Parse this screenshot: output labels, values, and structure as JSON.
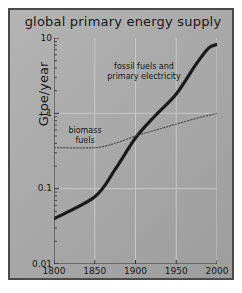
{
  "chart_data": {
    "type": "line",
    "title": "global primary energy supply",
    "xlabel": "",
    "ylabel": "Gtoe/year",
    "yscale": "log",
    "xlim": [
      1800,
      2000
    ],
    "ylim": [
      0.01,
      10
    ],
    "grid": true,
    "legend_position": "inline-annotations",
    "x_ticks": [
      "1800",
      "1850",
      "1900",
      "1950",
      "2000"
    ],
    "x_tick_values": [
      1800,
      1850,
      1900,
      1950,
      2000
    ],
    "y_ticks": [
      "0.01",
      "0.1",
      "1",
      "10"
    ],
    "y_tick_values": [
      0.01,
      0.1,
      1,
      10
    ],
    "series": [
      {
        "name": "fossil fuels and primary electricity",
        "style": "solid-thick",
        "color": "#1a1a1a",
        "x": [
          1800,
          1850,
          1875,
          1900,
          1925,
          1950,
          1975,
          1990,
          2000
        ],
        "values": [
          0.04,
          0.078,
          0.18,
          0.47,
          0.95,
          1.8,
          4.6,
          7.4,
          8.2
        ]
      },
      {
        "name": "biomass fuels",
        "style": "dotted-thin",
        "color": "#3a3a3a",
        "x": [
          1800,
          1850,
          1875,
          1900,
          1925,
          1950,
          1975,
          2000
        ],
        "values": [
          0.35,
          0.35,
          0.4,
          0.5,
          0.6,
          0.72,
          0.86,
          1.0
        ]
      }
    ],
    "annotations": [
      {
        "id": "fossil",
        "text": "fossil fuels and\nprimary electricity"
      },
      {
        "id": "biomass",
        "text": "biomass\nfuels"
      }
    ]
  },
  "colors": {
    "panel_background": "#a9a9a9",
    "frame_border": "#4a4a4a",
    "gridline": "#c8c8c8",
    "axis": "#2e2e2e",
    "text": "#17171b"
  }
}
